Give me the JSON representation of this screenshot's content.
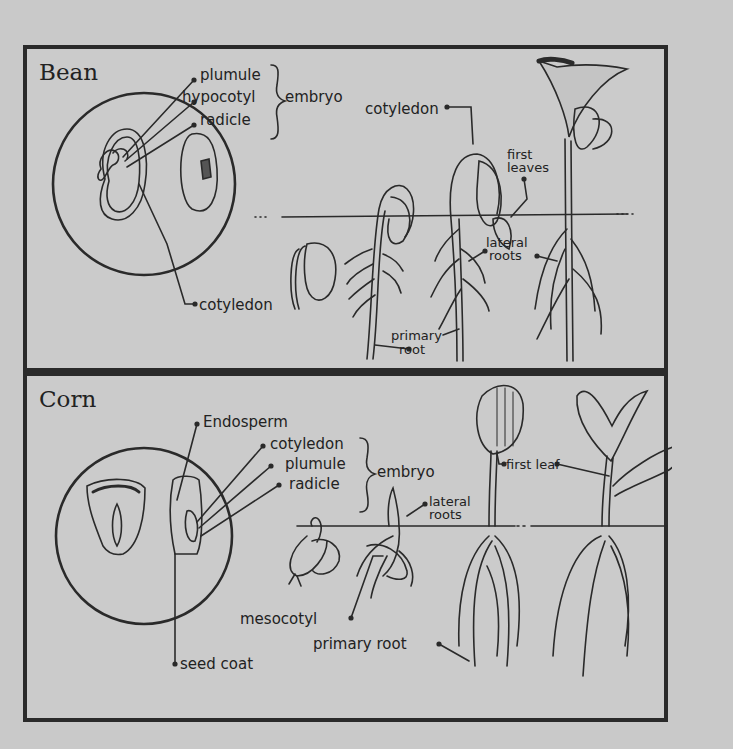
{
  "figure": {
    "background_color": "#c9c9c9",
    "line_color": "#2a2a2a"
  },
  "bean": {
    "title": "Bean",
    "embryo_parts": [
      "plumule",
      "hypocotyl",
      "radicle"
    ],
    "embryo_label": "embryo",
    "seed_labels": {
      "cotyledon": "cotyledon"
    },
    "seedling_labels": {
      "cotyledon": "cotyledon",
      "first_leaves_line1": "first",
      "first_leaves_line2": "leaves",
      "lateral_roots_line1": "lateral",
      "lateral_roots_line2": "roots",
      "primary_root_line1": "primary",
      "primary_root_line2": "root"
    }
  },
  "corn": {
    "title": "Corn",
    "endosperm_label": "Endosperm",
    "embryo_parts": [
      "cotyledon",
      "plumule",
      "radicle"
    ],
    "embryo_label": "embryo",
    "seed_labels": {
      "seed_coat": "seed coat"
    },
    "seedling_labels": {
      "first_leaf": "first leaf",
      "lateral_roots_line1": "lateral",
      "lateral_roots_line2": "roots",
      "mesocotyl": "mesocotyl",
      "primary_root": "primary root"
    }
  }
}
